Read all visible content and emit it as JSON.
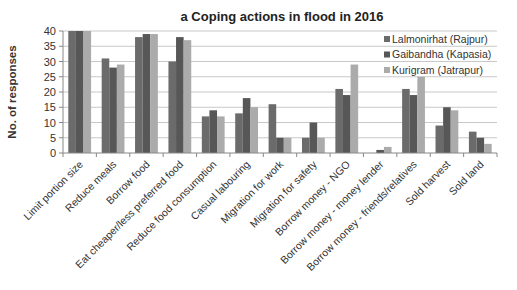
{
  "chart_data": {
    "type": "bar",
    "title": "a Coping actions in flood in 2016",
    "xlabel": "",
    "ylabel": "No. of responses",
    "ylim": [
      0,
      40
    ],
    "yticks": [
      0,
      5,
      10,
      15,
      20,
      25,
      30,
      35,
      40
    ],
    "grid": true,
    "legend_position": "upper right, inside plot",
    "categories": [
      "Limit portion size",
      "Reduce meals",
      "Borrow food",
      "Eat cheaper/less preferred food",
      "Reduce food consumption",
      "Casual labouring",
      "Migration for work",
      "Migration for safety",
      "Borrow money - NGO",
      "Borrow money - money lender",
      "Borrow money - friends/relatives",
      "Sold harvest",
      "Sold land"
    ],
    "series": [
      {
        "name": "Lalmonirhat (Rajpur)",
        "color": "#6b6b6b",
        "values": [
          40,
          31,
          38,
          30,
          12,
          13,
          16,
          5,
          21,
          0,
          21,
          9,
          7
        ]
      },
      {
        "name": "Gaibandha (Kapasia)",
        "color": "#575757",
        "values": [
          40,
          28,
          39,
          38,
          14,
          18,
          5,
          10,
          19,
          1,
          19,
          15,
          5
        ]
      },
      {
        "name": "Kurigram (Jatrapur)",
        "color": "#ababab",
        "values": [
          40,
          29,
          39,
          37,
          12,
          15,
          5,
          5,
          29,
          2,
          25,
          14,
          3
        ]
      }
    ]
  }
}
